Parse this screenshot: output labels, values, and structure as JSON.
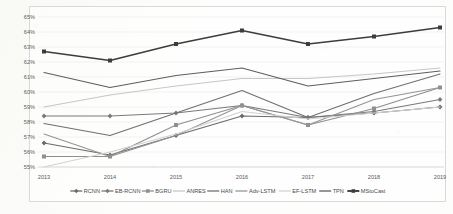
{
  "chart_data": {
    "type": "line",
    "title": "",
    "xlabel": "",
    "ylabel": "",
    "categories": [
      "2013",
      "2014",
      "2015",
      "2016",
      "2017",
      "2018",
      "2019"
    ],
    "x_tick_labels": [
      "2013",
      "2014",
      "2015",
      "2016",
      "2017",
      "2018",
      "2019"
    ],
    "y_tick_labels": [
      "55%",
      "56%",
      "57%",
      "58%",
      "59%",
      "60%",
      "61%",
      "62%",
      "63%",
      "64%",
      "65%"
    ],
    "y_tick_values": [
      55,
      56,
      57,
      58,
      59,
      60,
      61,
      62,
      63,
      64,
      65
    ],
    "ylim": [
      55,
      65
    ],
    "y_unit": "%",
    "grid": true,
    "legend_position": "bottom",
    "series": [
      {
        "name": "RCNN",
        "color": "#6b6b6b",
        "marker": "diamond",
        "values": [
          56.6,
          55.8,
          57.1,
          58.4,
          58.3,
          58.6,
          59.0
        ]
      },
      {
        "name": "EB-RCNN",
        "color": "#7a7a7a",
        "marker": "diamond",
        "values": [
          58.4,
          58.4,
          58.6,
          59.1,
          58.3,
          58.7,
          59.5
        ]
      },
      {
        "name": "BGRU",
        "color": "#8f8f8f",
        "marker": "square",
        "values": [
          55.7,
          55.7,
          57.8,
          59.1,
          57.8,
          58.9,
          60.3
        ]
      },
      {
        "name": "ANRES",
        "color": "#c6c6c6",
        "marker": "none",
        "values": [
          59.0,
          59.8,
          60.4,
          60.9,
          60.9,
          61.2,
          61.6
        ]
      },
      {
        "name": "HAN",
        "color": "#707070",
        "marker": "none",
        "values": [
          57.9,
          57.1,
          58.6,
          60.1,
          58.3,
          59.9,
          61.2
        ]
      },
      {
        "name": "Adv-LSTM",
        "color": "#959595",
        "marker": "none",
        "values": [
          57.2,
          55.7,
          57.1,
          59.1,
          57.8,
          59.5,
          60.3
        ]
      },
      {
        "name": "EF-LSTM",
        "color": "#d2d2d2",
        "marker": "none",
        "values": [
          55.0,
          56.0,
          57.2,
          58.7,
          58.2,
          58.6,
          59.0
        ]
      },
      {
        "name": "TPN",
        "color": "#5e5e5e",
        "marker": "none",
        "values": [
          61.3,
          60.3,
          61.1,
          61.6,
          60.4,
          60.9,
          61.4
        ]
      },
      {
        "name": "MStoCast",
        "color": "#3d3d3d",
        "marker": "square",
        "values": [
          62.7,
          62.1,
          63.2,
          64.1,
          63.2,
          63.7,
          64.3
        ]
      }
    ]
  }
}
